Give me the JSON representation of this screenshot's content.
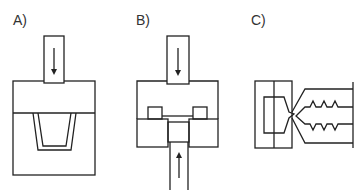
{
  "panels": [
    {
      "id": "A",
      "label": "A)",
      "description": "Compression molding: plunger pressing down into mold with cup-shaped cavity",
      "arrow": "down"
    },
    {
      "id": "B",
      "label": "B)",
      "description": "Transfer molding: upper plunger down, lower ejector up",
      "arrows": [
        "down",
        "up"
      ]
    },
    {
      "id": "C",
      "label": "C)",
      "description": "Injection molding: nozzle feeding mold cavity with serrated part"
    }
  ],
  "colors": {
    "line": "#222222",
    "text": "#333333",
    "background": "#ffffff"
  }
}
